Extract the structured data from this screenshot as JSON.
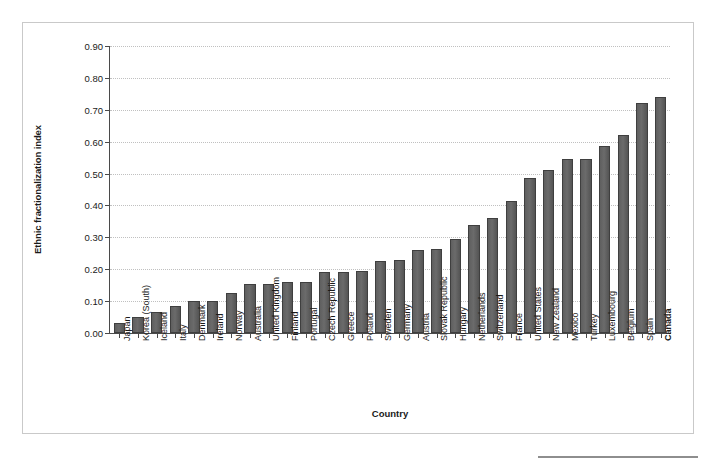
{
  "chart_data": {
    "type": "bar",
    "title": "",
    "subtitle": "",
    "xlabel": "Country",
    "ylabel": "Ethnic fractionalization index",
    "ylim": [
      0.0,
      0.9
    ],
    "ytick_labels": [
      "0.00",
      "0.10",
      "0.20",
      "0.30",
      "0.40",
      "0.50",
      "0.60",
      "0.70",
      "0.80",
      "0.90"
    ],
    "ytick_values": [
      0.0,
      0.1,
      0.2,
      0.3,
      0.4,
      0.5,
      0.6,
      0.7,
      0.8,
      0.9
    ],
    "grid": true,
    "grid_axis": "y",
    "legend": false,
    "legend_position": "none",
    "bar_color": "#5f5f5f",
    "bar_edge_color": "#3f3f3f",
    "grid_color": "#c0c0c0",
    "axis_color": "#4a4a4a",
    "categories": [
      "Japan",
      "Korea (South)",
      "Iceland",
      "Italy",
      "Denmark",
      "Ireland",
      "Norway",
      "Australia",
      "United Kingdom",
      "Finland",
      "Portugal",
      "Czech Republic",
      "Greece",
      "Poland",
      "Sweden",
      "Germany",
      "Austria",
      "Slovak Republic",
      "Hungary",
      "Netherlands",
      "Switzerland",
      "France",
      "United States",
      "New Zealand",
      "Mexico",
      "Turkey",
      "Luxembourg",
      "Belgium",
      "Spain",
      "Canada"
    ],
    "values": [
      0.03,
      0.05,
      0.065,
      0.085,
      0.1,
      0.1,
      0.125,
      0.155,
      0.155,
      0.16,
      0.16,
      0.19,
      0.19,
      0.195,
      0.225,
      0.23,
      0.26,
      0.265,
      0.295,
      0.34,
      0.36,
      0.415,
      0.485,
      0.51,
      0.545,
      0.545,
      0.585,
      0.62,
      0.72,
      0.74
    ],
    "highlighted_categories": [
      "Canada"
    ]
  }
}
